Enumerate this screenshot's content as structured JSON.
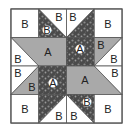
{
  "diagram": {
    "colors": {
      "white": "#ffffff",
      "gray": "#a9a9a9",
      "dark": "#4a4a4a",
      "border": "#555555",
      "text": "#222222"
    },
    "block": {
      "x": 11,
      "y": 9,
      "size": 111,
      "grid": 4
    },
    "labels": {
      "r0c0": "B",
      "r0c1_dark": "B",
      "r0c1_white": "B",
      "r0c2_white": "B",
      "r0c3": "B",
      "r1_gray_left": "A",
      "r1c0_white": "B",
      "r1c2_dark": "A",
      "r1c3_gray": "B",
      "r1c3_white": "B",
      "r2c0_white": "B",
      "r2c0_gray": "B",
      "r2c1_dark": "A",
      "r2_gray_right": "A",
      "r2c3_white": "B",
      "r3c0": "B",
      "r3c1_white": "B",
      "r3c2_white": "B",
      "r3c2_dark": "B",
      "r3c3": "B"
    }
  }
}
